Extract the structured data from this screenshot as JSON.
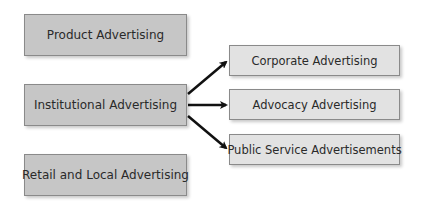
{
  "diagram": {
    "left_boxes": [
      {
        "label": "Product Advertising"
      },
      {
        "label": "Institutional Advertising"
      },
      {
        "label": "Retail and Local Advertising"
      }
    ],
    "right_boxes": [
      {
        "label": "Corporate Advertising"
      },
      {
        "label": "Advocacy Advertising"
      },
      {
        "label": "Public Service Advertisements"
      }
    ],
    "edges": [
      {
        "from": "Institutional Advertising",
        "to": "Corporate Advertising"
      },
      {
        "from": "Institutional Advertising",
        "to": "Advocacy Advertising"
      },
      {
        "from": "Institutional Advertising",
        "to": "Public Service Advertisements"
      }
    ],
    "colors": {
      "left_fill": "#c6c6c6",
      "right_fill": "#e2e2e2",
      "border": "#8a8a8a",
      "arrow": "#111111"
    }
  }
}
